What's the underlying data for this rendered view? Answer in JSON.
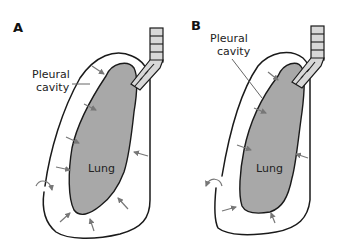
{
  "figure": {
    "panels": [
      {
        "id": "A",
        "label": "A",
        "pleural_label_line1": "Pleural",
        "pleural_label_line2": "cavity",
        "lung_label": "Lung"
      },
      {
        "id": "B",
        "label": "B",
        "pleural_label_line1": "Pleural",
        "pleural_label_line2": "cavity",
        "lung_label": "Lung"
      }
    ],
    "colors": {
      "lung_fill": "#a8a8a8",
      "trachea_fill": "#d8d8d8",
      "outline": "#1a1a1a",
      "arrow": "#777777"
    }
  }
}
